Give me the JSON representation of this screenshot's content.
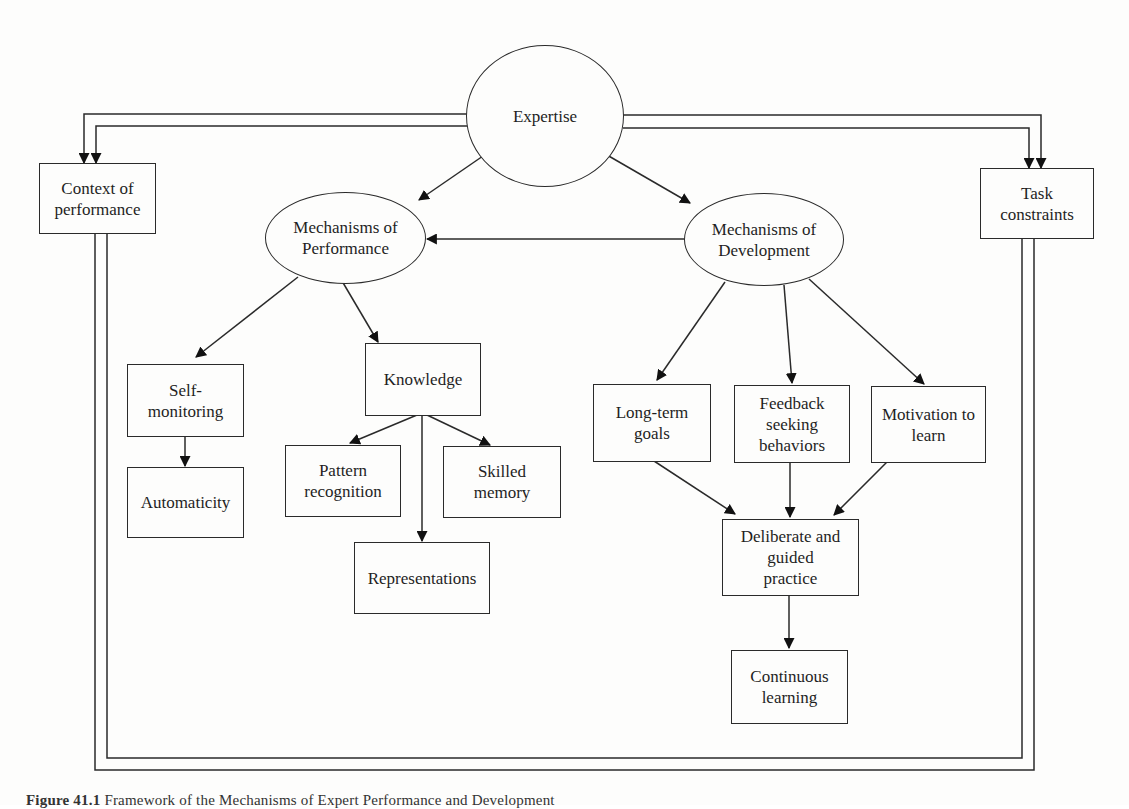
{
  "diagram": {
    "type": "flowchart",
    "nodes": {
      "expertise": {
        "label": "Expertise",
        "shape": "ellipse"
      },
      "context_of_performance": {
        "label": "Context of\nperformance",
        "shape": "box"
      },
      "task_constraints": {
        "label": "Task\nconstraints",
        "shape": "box"
      },
      "mechanisms_of_performance": {
        "label": "Mechanisms of\nPerformance",
        "shape": "ellipse"
      },
      "mechanisms_of_development": {
        "label": "Mechanisms of\nDevelopment",
        "shape": "ellipse"
      },
      "self_monitoring": {
        "label": "Self-\nmonitoring",
        "shape": "box"
      },
      "automaticity": {
        "label": "Automaticity",
        "shape": "box"
      },
      "knowledge": {
        "label": "Knowledge",
        "shape": "box"
      },
      "pattern_recognition": {
        "label": "Pattern\nrecognition",
        "shape": "box"
      },
      "skilled_memory": {
        "label": "Skilled\nmemory",
        "shape": "box"
      },
      "representations": {
        "label": "Representations",
        "shape": "box"
      },
      "long_term_goals": {
        "label": "Long-term\ngoals",
        "shape": "box"
      },
      "feedback_seeking": {
        "label": "Feedback\nseeking\nbehaviors",
        "shape": "box"
      },
      "motivation_to_learn": {
        "label": "Motivation to\nlearn",
        "shape": "box"
      },
      "deliberate_practice": {
        "label": "Deliberate and\nguided\npractice",
        "shape": "box"
      },
      "continuous_learning": {
        "label": "Continuous\nlearning",
        "shape": "box"
      }
    },
    "edges": [
      {
        "from": "expertise",
        "to": "context_of_performance",
        "style": "double-line"
      },
      {
        "from": "expertise",
        "to": "task_constraints",
        "style": "double-line"
      },
      {
        "from": "expertise",
        "to": "mechanisms_of_performance"
      },
      {
        "from": "expertise",
        "to": "mechanisms_of_development"
      },
      {
        "from": "mechanisms_of_development",
        "to": "mechanisms_of_performance"
      },
      {
        "from": "mechanisms_of_performance",
        "to": "self_monitoring"
      },
      {
        "from": "mechanisms_of_performance",
        "to": "knowledge"
      },
      {
        "from": "self_monitoring",
        "to": "automaticity"
      },
      {
        "from": "knowledge",
        "to": "pattern_recognition"
      },
      {
        "from": "knowledge",
        "to": "skilled_memory"
      },
      {
        "from": "knowledge",
        "to": "representations"
      },
      {
        "from": "mechanisms_of_development",
        "to": "long_term_goals"
      },
      {
        "from": "mechanisms_of_development",
        "to": "feedback_seeking"
      },
      {
        "from": "mechanisms_of_development",
        "to": "motivation_to_learn"
      },
      {
        "from": "long_term_goals",
        "to": "deliberate_practice"
      },
      {
        "from": "feedback_seeking",
        "to": "deliberate_practice"
      },
      {
        "from": "motivation_to_learn",
        "to": "deliberate_practice"
      },
      {
        "from": "deliberate_practice",
        "to": "continuous_learning"
      },
      {
        "from": "context_of_performance",
        "to": "task_constraints",
        "style": "double-line enclosing frame"
      }
    ]
  },
  "caption": {
    "label": "Figure 41.1",
    "text": "Framework of the Mechanisms of Expert Performance and Development"
  }
}
